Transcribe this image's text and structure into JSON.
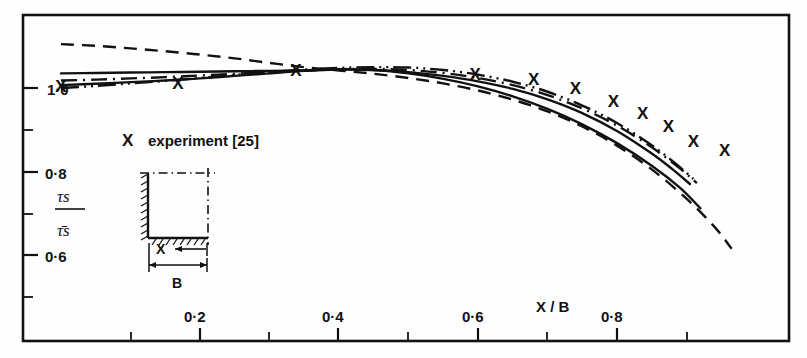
{
  "chart_data": {
    "type": "line",
    "title": "",
    "xlabel": "X / B",
    "ylabel_num": "τs",
    "ylabel_den": "τ̄s",
    "xlim": [
      0.0,
      1.0
    ],
    "ylim": [
      0.5,
      1.12
    ],
    "grid": false,
    "legend_position": "inside-left",
    "x_ticks_major": [
      0.2,
      0.4,
      0.6,
      0.8
    ],
    "x_ticks_major_labels": [
      "0·2",
      "0·4",
      "0·6",
      "0·8"
    ],
    "x_ticks_minor": [
      0.1,
      0.3,
      0.5,
      0.7,
      0.9
    ],
    "y_ticks_major": [
      1.0,
      0.8,
      0.6
    ],
    "y_ticks_major_labels": [
      "1·0",
      "0·8",
      "0·6"
    ],
    "y_ticks_minor": [
      0.9,
      0.7,
      0.5
    ],
    "series": [
      {
        "name": "prediction-solid-upper",
        "style": "solid",
        "points": [
          [
            0.0,
            1.035
          ],
          [
            0.05,
            1.036
          ],
          [
            0.1,
            1.037
          ],
          [
            0.15,
            1.038
          ],
          [
            0.2,
            1.039
          ],
          [
            0.25,
            1.04
          ],
          [
            0.3,
            1.041
          ],
          [
            0.35,
            1.042
          ],
          [
            0.4,
            1.044
          ],
          [
            0.45,
            1.043
          ],
          [
            0.5,
            1.038
          ],
          [
            0.55,
            1.029
          ],
          [
            0.6,
            1.016
          ],
          [
            0.65,
            0.998
          ],
          [
            0.7,
            0.973
          ],
          [
            0.75,
            0.94
          ],
          [
            0.8,
            0.897
          ],
          [
            0.85,
            0.843
          ],
          [
            0.88,
            0.805
          ],
          [
            0.905,
            0.77
          ]
        ]
      },
      {
        "name": "prediction-solid-lower",
        "style": "solid",
        "points": [
          [
            0.0,
            1.007
          ],
          [
            0.05,
            1.01
          ],
          [
            0.1,
            1.014
          ],
          [
            0.15,
            1.018
          ],
          [
            0.2,
            1.023
          ],
          [
            0.25,
            1.029
          ],
          [
            0.3,
            1.035
          ],
          [
            0.35,
            1.041
          ],
          [
            0.4,
            1.045
          ],
          [
            0.45,
            1.043
          ],
          [
            0.5,
            1.035
          ],
          [
            0.55,
            1.022
          ],
          [
            0.6,
            1.004
          ],
          [
            0.65,
            0.98
          ],
          [
            0.7,
            0.95
          ],
          [
            0.75,
            0.913
          ],
          [
            0.8,
            0.868
          ],
          [
            0.85,
            0.814
          ],
          [
            0.89,
            0.762
          ],
          [
            0.92,
            0.712
          ]
        ]
      },
      {
        "name": "prediction-dashed",
        "style": "dashed",
        "points": [
          [
            0.0,
            1.105
          ],
          [
            0.05,
            1.101
          ],
          [
            0.1,
            1.095
          ],
          [
            0.15,
            1.088
          ],
          [
            0.2,
            1.08
          ],
          [
            0.25,
            1.071
          ],
          [
            0.3,
            1.06
          ],
          [
            0.35,
            1.05
          ],
          [
            0.4,
            1.042
          ],
          [
            0.45,
            1.034
          ],
          [
            0.5,
            1.024
          ],
          [
            0.55,
            1.011
          ],
          [
            0.6,
            0.994
          ],
          [
            0.65,
            0.972
          ],
          [
            0.7,
            0.944
          ],
          [
            0.75,
            0.908
          ],
          [
            0.8,
            0.862
          ],
          [
            0.85,
            0.805
          ],
          [
            0.9,
            0.735
          ],
          [
            0.94,
            0.668
          ],
          [
            0.965,
            0.615
          ]
        ]
      },
      {
        "name": "prediction-dashdot",
        "style": "dashdot",
        "points": [
          [
            0.0,
            1.018
          ],
          [
            0.05,
            1.02
          ],
          [
            0.1,
            1.023
          ],
          [
            0.15,
            1.026
          ],
          [
            0.2,
            1.03
          ],
          [
            0.25,
            1.034
          ],
          [
            0.3,
            1.038
          ],
          [
            0.35,
            1.042
          ],
          [
            0.4,
            1.045
          ],
          [
            0.45,
            1.046
          ],
          [
            0.5,
            1.043
          ],
          [
            0.55,
            1.036
          ],
          [
            0.6,
            1.024
          ],
          [
            0.65,
            1.007
          ],
          [
            0.7,
            0.983
          ],
          [
            0.75,
            0.951
          ],
          [
            0.8,
            0.91
          ],
          [
            0.85,
            0.858
          ],
          [
            0.89,
            0.808
          ],
          [
            0.915,
            0.772
          ]
        ]
      },
      {
        "name": "prediction-dashdotdot",
        "style": "dashdotdot",
        "points": [
          [
            0.0,
            1.0
          ],
          [
            0.05,
            1.005
          ],
          [
            0.1,
            1.011
          ],
          [
            0.15,
            1.017
          ],
          [
            0.2,
            1.024
          ],
          [
            0.25,
            1.031
          ],
          [
            0.3,
            1.038
          ],
          [
            0.35,
            1.044
          ],
          [
            0.4,
            1.048
          ],
          [
            0.45,
            1.05
          ],
          [
            0.5,
            1.049
          ],
          [
            0.55,
            1.043
          ],
          [
            0.6,
            1.032
          ],
          [
            0.65,
            1.015
          ],
          [
            0.7,
            0.991
          ],
          [
            0.75,
            0.958
          ],
          [
            0.8,
            0.916
          ],
          [
            0.85,
            0.863
          ],
          [
            0.885,
            0.818
          ],
          [
            0.91,
            0.782
          ]
        ]
      }
    ],
    "experiment": {
      "name": "experiment [25]",
      "marker": "X",
      "points": [
        [
          0.0,
          1.006
        ],
        [
          0.168,
          1.013
        ],
        [
          0.338,
          1.043
        ],
        [
          0.596,
          1.033
        ],
        [
          0.68,
          1.021
        ],
        [
          0.74,
          1.001
        ],
        [
          0.795,
          0.969
        ],
        [
          0.837,
          0.94
        ],
        [
          0.874,
          0.908
        ],
        [
          0.91,
          0.874
        ],
        [
          0.955,
          0.851
        ]
      ]
    }
  },
  "legend": {
    "marker": "X",
    "label": "experiment [25]"
  },
  "inset": {
    "x_label": "X",
    "b_label": "B",
    "description": "duct-quadrant-cross-section"
  }
}
